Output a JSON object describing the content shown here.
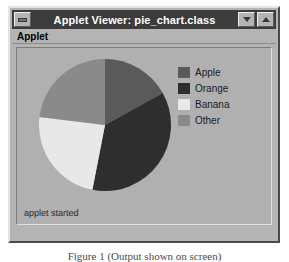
{
  "window": {
    "title": "Applet Viewer: pie_chart.class",
    "controls": {
      "system_menu": "minimize-box",
      "minimize": "minimize-arrow",
      "maximize": "maximize-arrow"
    }
  },
  "menu": {
    "items": [
      {
        "label": "Applet"
      }
    ]
  },
  "status": {
    "text": "applet started"
  },
  "caption": {
    "text": "Figure 1 (Output shown on screen)"
  },
  "colors": {
    "window_face": "#b4b4b4",
    "title_bar": "#3c3c3c",
    "title_text": "#ffffff",
    "canvas": "#b0b0b0",
    "apple": "#5a5a5a",
    "orange": "#2e2e2e",
    "banana": "#e8e8e8",
    "other": "#8a8a8a"
  },
  "chart_data": {
    "type": "pie",
    "title": "",
    "legend_position": "right",
    "categories": [
      "Apple",
      "Orange",
      "Banana",
      "Other"
    ],
    "values": [
      17,
      36,
      24,
      23
    ],
    "units": "percent",
    "start_angle_deg": -90,
    "slices": [
      {
        "label": "Apple",
        "value": 17,
        "angle_deg": 61,
        "color": "#5a5a5a"
      },
      {
        "label": "Orange",
        "value": 36,
        "angle_deg": 130,
        "color": "#2e2e2e"
      },
      {
        "label": "Banana",
        "value": 24,
        "angle_deg": 86,
        "color": "#e8e8e8"
      },
      {
        "label": "Other",
        "value": 23,
        "angle_deg": 83,
        "color": "#8a8a8a"
      }
    ]
  },
  "legend": {
    "entries": [
      {
        "label": "Apple",
        "color": "#5a5a5a"
      },
      {
        "label": "Orange",
        "color": "#2e2e2e"
      },
      {
        "label": "Banana",
        "color": "#e8e8e8"
      },
      {
        "label": "Other",
        "color": "#8a8a8a"
      }
    ]
  }
}
